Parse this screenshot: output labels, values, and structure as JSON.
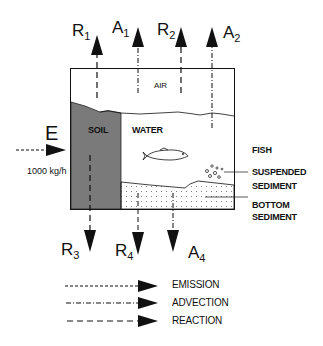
{
  "diagram": {
    "title": "",
    "compartments": {
      "air": "AIR",
      "soil": "SOIL",
      "water": "WATER",
      "fish": "FISH",
      "suspended_sediment": [
        "SUSPENDED",
        "SEDIMENT"
      ],
      "bottom_sediment": [
        "BOTTOM",
        "SEDIMENT"
      ]
    },
    "emission": {
      "label": "E",
      "rate": "1000 kg/h"
    },
    "outflows_top": [
      {
        "symbol": "R",
        "sub": "1",
        "type": "reaction"
      },
      {
        "symbol": "A",
        "sub": "1",
        "type": "advection"
      },
      {
        "symbol": "R",
        "sub": "2",
        "type": "reaction"
      },
      {
        "symbol": "A",
        "sub": "2",
        "type": "advection"
      }
    ],
    "outflows_bottom": [
      {
        "symbol": "R",
        "sub": "3",
        "type": "reaction"
      },
      {
        "symbol": "R",
        "sub": "4",
        "type": "reaction"
      },
      {
        "symbol": "A",
        "sub": "4",
        "type": "advection"
      }
    ],
    "legend": [
      {
        "style": "dotted",
        "label": "EMISSION"
      },
      {
        "style": "dash-dot",
        "label": "ADVECTION"
      },
      {
        "style": "dashed",
        "label": "REACTION"
      }
    ]
  },
  "colors": {
    "soil_fill": "#7a7a7a",
    "line": "#111111",
    "background": "#ffffff"
  }
}
